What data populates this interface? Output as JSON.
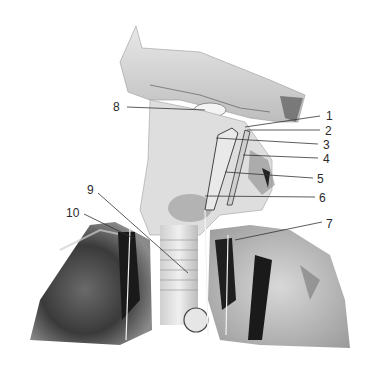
{
  "figure": {
    "background_color": "#ffffff",
    "specimen_tones": [
      "#f2f2f2",
      "#d9d9d9",
      "#a6a6a6",
      "#5a5a5a",
      "#1a1a1a"
    ]
  },
  "labels": [
    {
      "id": "1",
      "text": "1",
      "x": 328,
      "y": 120,
      "line": [
        245,
        127,
        320,
        116
      ]
    },
    {
      "id": "2",
      "text": "2",
      "x": 327,
      "y": 135,
      "line": [
        247,
        130,
        320,
        130
      ]
    },
    {
      "id": "3",
      "text": "3",
      "x": 326,
      "y": 149,
      "line": [
        216,
        138,
        318,
        144
      ]
    },
    {
      "id": "4",
      "text": "4",
      "x": 326,
      "y": 163,
      "line": [
        243,
        155,
        318,
        158
      ]
    },
    {
      "id": "5",
      "text": "5",
      "x": 320,
      "y": 183,
      "line": [
        225,
        172,
        313,
        178
      ]
    },
    {
      "id": "6",
      "text": "6",
      "x": 322,
      "y": 202,
      "line": [
        205,
        196,
        315,
        197
      ]
    },
    {
      "id": "7",
      "text": "7",
      "x": 326,
      "y": 228,
      "line": [
        235,
        240,
        322,
        222
      ]
    },
    {
      "id": "8",
      "text": "8",
      "x": 113,
      "y": 111,
      "line": [
        127,
        107,
        205,
        110
      ]
    },
    {
      "id": "9",
      "text": "9",
      "x": 87,
      "y": 194,
      "line": [
        98,
        193,
        188,
        273
      ]
    },
    {
      "id": "10",
      "text": "10",
      "x": 66,
      "y": 217,
      "line": [
        84,
        214,
        133,
        238
      ]
    }
  ]
}
